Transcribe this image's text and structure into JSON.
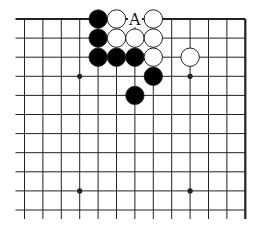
{
  "diagram": {
    "type": "go-board-corner",
    "colors": {
      "line": "#222222",
      "black_stone": "#000000",
      "white_stone": "#ffffff",
      "stone_outline": "#222222",
      "background": "#ffffff"
    },
    "grid": {
      "columns": 13,
      "rows": 11,
      "origin_x": 24.5,
      "origin_y": 19,
      "spacing_x": 18.4,
      "spacing_y": 19.1,
      "edges": [
        "top",
        "right"
      ]
    },
    "star_points": [
      {
        "col": 3,
        "row": 3
      },
      {
        "col": 9,
        "row": 3
      },
      {
        "col": 3,
        "row": 9
      },
      {
        "col": 9,
        "row": 9
      }
    ],
    "stones": [
      {
        "col": 4,
        "row": 0,
        "color": "black"
      },
      {
        "col": 5,
        "row": 0,
        "color": "white"
      },
      {
        "col": 7,
        "row": 0,
        "color": "white"
      },
      {
        "col": 4,
        "row": 1,
        "color": "black"
      },
      {
        "col": 5,
        "row": 1,
        "color": "white"
      },
      {
        "col": 6,
        "row": 1,
        "color": "white"
      },
      {
        "col": 7,
        "row": 1,
        "color": "white"
      },
      {
        "col": 4,
        "row": 2,
        "color": "black"
      },
      {
        "col": 5,
        "row": 2,
        "color": "black"
      },
      {
        "col": 6,
        "row": 2,
        "color": "black"
      },
      {
        "col": 7,
        "row": 2,
        "color": "white"
      },
      {
        "col": 9,
        "row": 2,
        "color": "white"
      },
      {
        "col": 7,
        "row": 3,
        "color": "black"
      },
      {
        "col": 6,
        "row": 4,
        "color": "black"
      }
    ],
    "labels": [
      {
        "col": 6,
        "row": 0,
        "text": "A"
      }
    ]
  }
}
